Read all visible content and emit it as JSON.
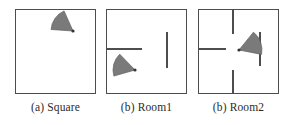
{
  "figure": {
    "width": 302,
    "height": 125,
    "background_color": "#ffffff",
    "wall_color": "#4d4d4d",
    "agent_fill_color": "#7a7a7a",
    "agent_outline_color": "#5f5f5f",
    "agent_origin_color": "#333333",
    "caption_color": "#2b2b2b"
  },
  "panels": [
    {
      "id": "square",
      "caption": "(a) Square",
      "caption_label": "(a)",
      "caption_name": "Square",
      "box": {
        "x": 15,
        "y": 9,
        "w": 81,
        "h": 85
      },
      "walls": [],
      "agent": {
        "name": "agent-fov-cone",
        "origin_x": 73,
        "origin_y": 31,
        "heading_deg": 215,
        "fov_deg": 62,
        "radius": 22
      }
    },
    {
      "id": "room1",
      "caption": "(b) Room1",
      "caption_label": "(b)",
      "caption_name": "Room1",
      "box": {
        "x": 106,
        "y": 9,
        "w": 81,
        "h": 85
      },
      "walls": [
        {
          "name": "wall-left-horizontal",
          "orientation": "horizontal",
          "x": 106,
          "y": 48,
          "length": 36,
          "thickness": 1.6
        },
        {
          "name": "wall-center-vertical",
          "orientation": "vertical",
          "x": 166,
          "y": 32,
          "length": 36,
          "thickness": 1.6
        }
      ],
      "agent": {
        "name": "agent-fov-cone",
        "origin_x": 135,
        "origin_y": 70,
        "heading_deg": 195,
        "fov_deg": 62,
        "radius": 22
      }
    },
    {
      "id": "room2",
      "caption": "(b) Room2",
      "caption_label": "(b)",
      "caption_name": "Room2",
      "box": {
        "x": 198,
        "y": 9,
        "w": 81,
        "h": 85
      },
      "walls": [
        {
          "name": "wall-top-vertical",
          "orientation": "vertical",
          "x": 232,
          "y": 9,
          "length": 25,
          "thickness": 1.6
        },
        {
          "name": "wall-left-horizontal",
          "orientation": "horizontal",
          "x": 198,
          "y": 48,
          "length": 28,
          "thickness": 1.6
        },
        {
          "name": "wall-center-vertical",
          "orientation": "vertical",
          "x": 259,
          "y": 32,
          "length": 34,
          "thickness": 1.6
        },
        {
          "name": "wall-bottom-vertical",
          "orientation": "vertical",
          "x": 232,
          "y": 70,
          "length": 24,
          "thickness": 1.6
        }
      ],
      "agent": {
        "name": "agent-fov-cone",
        "origin_x": 239,
        "origin_y": 50,
        "heading_deg": 340,
        "fov_deg": 62,
        "radius": 23
      }
    }
  ],
  "captions": {
    "y": 101,
    "font_size_px": 11.5
  }
}
